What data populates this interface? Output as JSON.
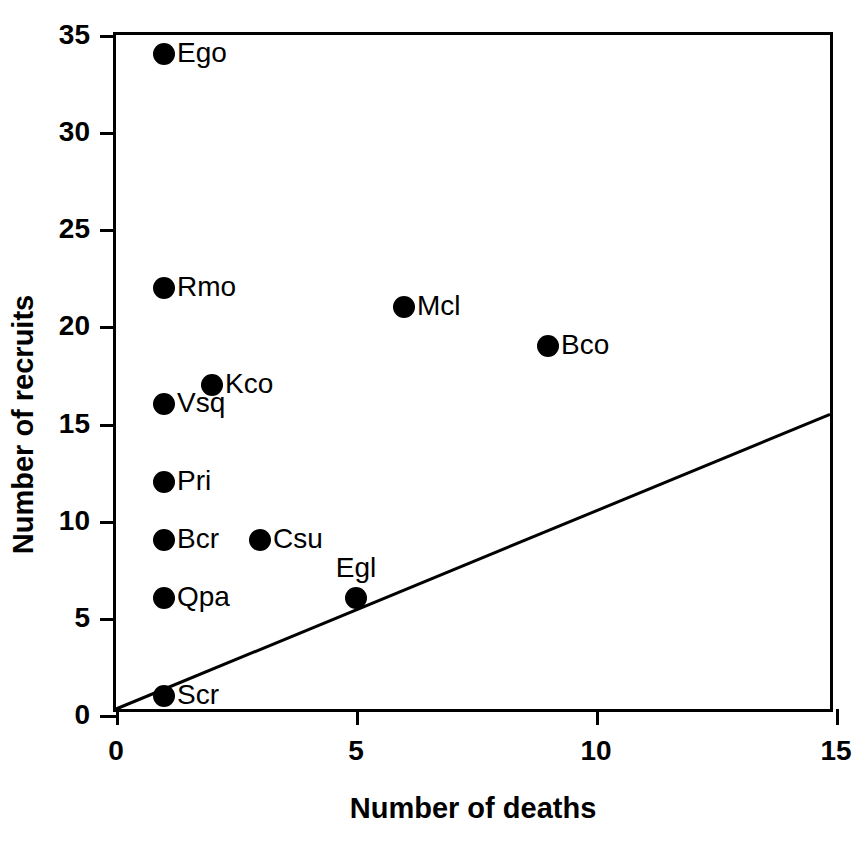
{
  "chart_data": {
    "type": "scatter",
    "title": "",
    "xlabel": "Number of deaths",
    "ylabel": "Number of recruits",
    "xlim": [
      0,
      15
    ],
    "ylim": [
      0,
      35
    ],
    "xticks": [
      0,
      5,
      10,
      15
    ],
    "yticks": [
      0,
      5,
      10,
      15,
      20,
      25,
      30,
      35
    ],
    "xticklabels": [
      "0",
      "5",
      "10",
      "15"
    ],
    "yticklabels": [
      "0",
      "5",
      "10",
      "15",
      "20",
      "25",
      "30",
      "35"
    ],
    "grid": false,
    "legend": null,
    "marker": "filled-circle",
    "marker_color": "#000000",
    "points": [
      {
        "label": "Ego",
        "x": 1,
        "y": 34,
        "label_pos": "right"
      },
      {
        "label": "Rmo",
        "x": 1,
        "y": 22,
        "label_pos": "right"
      },
      {
        "label": "Mcl",
        "x": 6,
        "y": 21,
        "label_pos": "right"
      },
      {
        "label": "Bco",
        "x": 9,
        "y": 19,
        "label_pos": "right"
      },
      {
        "label": "Kco",
        "x": 2,
        "y": 17,
        "label_pos": "right"
      },
      {
        "label": "Vsq",
        "x": 1,
        "y": 16,
        "label_pos": "right"
      },
      {
        "label": "Pri",
        "x": 1,
        "y": 12,
        "label_pos": "right"
      },
      {
        "label": "Bcr",
        "x": 1,
        "y": 9,
        "label_pos": "right"
      },
      {
        "label": "Csu",
        "x": 3,
        "y": 9,
        "label_pos": "right"
      },
      {
        "label": "Qpa",
        "x": 1,
        "y": 6,
        "label_pos": "right"
      },
      {
        "label": "Egl",
        "x": 5,
        "y": 6,
        "label_pos": "above"
      },
      {
        "label": "Scr",
        "x": 1,
        "y": 1,
        "label_pos": "right"
      }
    ],
    "reference_line": {
      "name": "1:1-replacement-line",
      "x": [
        0,
        15
      ],
      "y": [
        0,
        15.3
      ],
      "color": "#000000",
      "width": 3
    }
  }
}
